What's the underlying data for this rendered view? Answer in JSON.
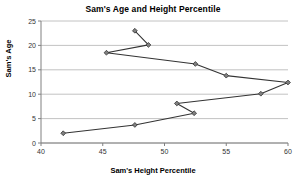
{
  "chart_data": {
    "type": "line",
    "title": "Sam's Age and Height Percentile",
    "xlabel": "Sam's Height Percentile",
    "ylabel": "Sam's Age",
    "xlim": [
      40,
      60
    ],
    "ylim": [
      0,
      25
    ],
    "xticks": [
      40,
      45,
      50,
      55,
      60
    ],
    "yticks": [
      0,
      5,
      10,
      15,
      20,
      25
    ],
    "grid": "horizontal",
    "legend": "none",
    "marker": "diamond",
    "line_color": "#333333",
    "marker_color": "#808080",
    "grid_color": "#b3b3b3",
    "series": [
      {
        "name": "Sam",
        "points": [
          {
            "x": 41.8,
            "y": 2.0
          },
          {
            "x": 47.6,
            "y": 3.7
          },
          {
            "x": 52.4,
            "y": 6.1
          },
          {
            "x": 51.0,
            "y": 8.1
          },
          {
            "x": 57.8,
            "y": 10.1
          },
          {
            "x": 60.0,
            "y": 12.4
          },
          {
            "x": 55.0,
            "y": 13.8
          },
          {
            "x": 52.5,
            "y": 16.2
          },
          {
            "x": 45.3,
            "y": 18.5
          },
          {
            "x": 48.7,
            "y": 20.1
          },
          {
            "x": 47.6,
            "y": 23.0
          }
        ]
      }
    ]
  },
  "plot_geometry": {
    "left": 41,
    "right": 288,
    "top": 21,
    "bottom": 143
  }
}
